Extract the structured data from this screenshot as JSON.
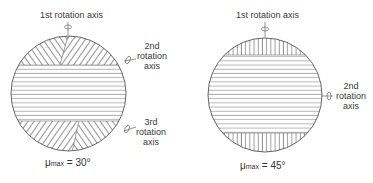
{
  "figures": [
    {
      "id": "left",
      "axes": [
        {
          "label": "1st rotation axis",
          "position": "top"
        },
        {
          "label_lines": [
            "2nd",
            "rotation",
            "axis"
          ],
          "position": "right-upper"
        },
        {
          "label_lines": [
            "3rd",
            "rotation",
            "axis"
          ],
          "position": "right-lower"
        }
      ],
      "mu_symbol": "μ",
      "mu_subscript": "max",
      "mu_value": "= 30°",
      "hatching": {
        "caps": "diagonal-herringbone",
        "middle": "horizontal"
      }
    },
    {
      "id": "right",
      "axes": [
        {
          "label": "1st rotation axis",
          "position": "top"
        },
        {
          "label_lines": [
            "2nd",
            "rotation",
            "axis"
          ],
          "position": "right"
        }
      ],
      "mu_symbol": "μ",
      "mu_subscript": "max",
      "mu_value": "= 45°",
      "hatching": {
        "caps": "vertical",
        "middle": "horizontal"
      }
    }
  ],
  "colors": {
    "line": "#555555",
    "background": "#ffffff"
  }
}
